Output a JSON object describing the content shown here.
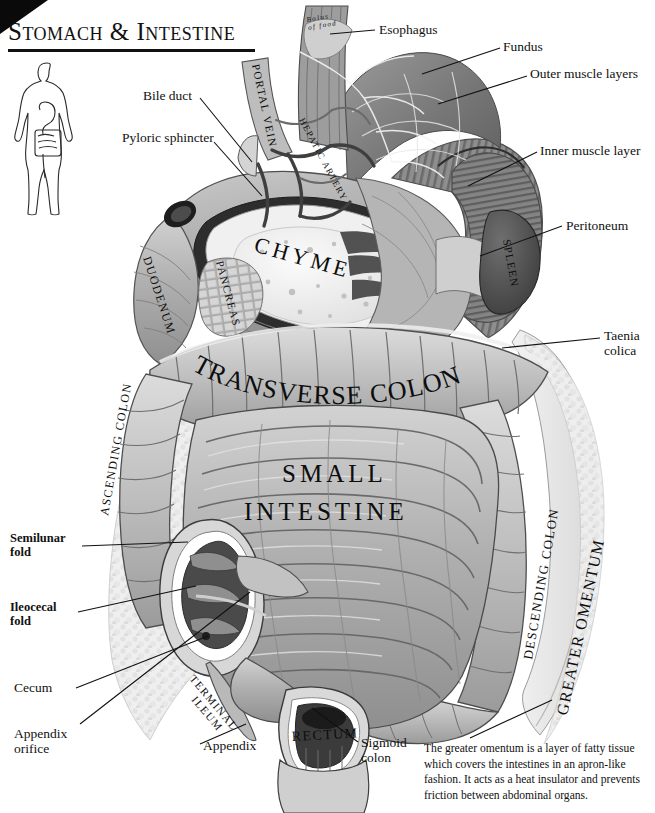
{
  "page": {
    "title": "Stomach & Intestine",
    "background_color": "#ffffff",
    "ink_color": "#111111"
  },
  "figure_key": {
    "body_silhouette_label": "human body silhouette with digestive tract"
  },
  "callouts": [
    {
      "id": "esophagus",
      "text": "Esophagus",
      "x": 379,
      "y": 22,
      "bold": false
    },
    {
      "id": "fundus",
      "text": "Fundus",
      "x": 503,
      "y": 39,
      "bold": false
    },
    {
      "id": "outer-muscle",
      "text": "Outer muscle layers",
      "x": 530,
      "y": 66,
      "bold": false
    },
    {
      "id": "inner-muscle",
      "text": "Inner muscle layer",
      "x": 540,
      "y": 143,
      "bold": false
    },
    {
      "id": "peritoneum",
      "text": "Peritoneum",
      "x": 566,
      "y": 218,
      "bold": false
    },
    {
      "id": "bile-duct",
      "text": "Bile duct",
      "x": 143,
      "y": 88,
      "bold": false
    },
    {
      "id": "pyloric-sphincter",
      "text": "Pyloric sphincter",
      "x": 122,
      "y": 130,
      "bold": false
    },
    {
      "id": "taenia-colica",
      "text": "Taenia\ncolica",
      "x": 604,
      "y": 328,
      "bold": false
    },
    {
      "id": "semilunar-fold",
      "text": "Semilunar\nfold",
      "x": 10,
      "y": 531,
      "bold": true
    },
    {
      "id": "ileocecal-fold",
      "text": "Ileocecal\nfold",
      "x": 10,
      "y": 600,
      "bold": true
    },
    {
      "id": "cecum",
      "text": "Cecum",
      "x": 14,
      "y": 680,
      "bold": false
    },
    {
      "id": "appendix-orifice",
      "text": "Appendix\norifice",
      "x": 14,
      "y": 726,
      "bold": false
    },
    {
      "id": "appendix",
      "text": "Appendix",
      "x": 203,
      "y": 738,
      "bold": false
    },
    {
      "id": "sigmoid-colon",
      "text": "Sigmoid\ncolon",
      "x": 361,
      "y": 735,
      "bold": false
    }
  ],
  "organ_labels": [
    {
      "id": "bolus-of-food",
      "text": "Bolus\nof food",
      "x": 307,
      "y": 22,
      "size": 7,
      "rotate": -10,
      "style": "italic"
    },
    {
      "id": "portal-vein",
      "text": "PORTAL VEIN",
      "x": 252,
      "y": 65,
      "size": 11,
      "rotate": 78,
      "style": "normal"
    },
    {
      "id": "hepatic-artery",
      "text": "HEPATIC ARTERY",
      "x": 299,
      "y": 120,
      "size": 9,
      "rotate": 62,
      "style": "normal"
    },
    {
      "id": "spleen",
      "text": "SPLEEN",
      "x": 503,
      "y": 240,
      "size": 11,
      "rotate": 80,
      "style": "normal"
    },
    {
      "id": "duodenum",
      "text": "DUODENUM",
      "x": 143,
      "y": 258,
      "size": 12,
      "rotate": 72,
      "style": "normal"
    },
    {
      "id": "pancreas",
      "text": "PANCREAS",
      "x": 216,
      "y": 262,
      "size": 11,
      "rotate": 75,
      "style": "normal"
    },
    {
      "id": "chyme",
      "text": "CHYME",
      "x": 253,
      "y": 251,
      "size": 22,
      "rotate": 16,
      "style": "normal"
    },
    {
      "id": "ascending-colon",
      "text": "ASCENDING COLON",
      "x": 108,
      "y": 516,
      "size": 12,
      "rotate": -80,
      "style": "normal"
    },
    {
      "id": "transverse-colon",
      "text": "TRANSVERSE COLON",
      "x": 186,
      "y": 374,
      "size": 26,
      "rotate": 0,
      "style": "arched"
    },
    {
      "id": "descending-colon",
      "text": "DESCENDING COLON",
      "x": 532,
      "y": 660,
      "size": 13,
      "rotate": -80,
      "style": "normal"
    },
    {
      "id": "greater-omentum",
      "text": "GREATER OMENTUM",
      "x": 567,
      "y": 716,
      "size": 16,
      "rotate": -78,
      "style": "normal"
    },
    {
      "id": "small-intestine-1",
      "text": "SMALL",
      "x": 282,
      "y": 482,
      "size": 25,
      "rotate": 0,
      "style": "normal"
    },
    {
      "id": "small-intestine-2",
      "text": "INTESTINE",
      "x": 244,
      "y": 520,
      "size": 25,
      "rotate": 0,
      "style": "normal"
    },
    {
      "id": "terminal-ileum",
      "text": "TERMINAL",
      "x": 189,
      "y": 679,
      "size": 11,
      "rotate": 50,
      "style": "normal"
    },
    {
      "id": "terminal-ileum-2",
      "text": "ILEUM",
      "x": 191,
      "y": 700,
      "size": 11,
      "rotate": 50,
      "style": "normal"
    },
    {
      "id": "rectum",
      "text": "RECTUM",
      "x": 292,
      "y": 741,
      "size": 14,
      "rotate": -3,
      "style": "normal"
    }
  ],
  "caption": {
    "text": "The greater omentum is a layer of  fatty tissue which covers the intestines  in an apron-like fashion. It acts as a heat insulator and prevents friction between abdominal organs."
  }
}
